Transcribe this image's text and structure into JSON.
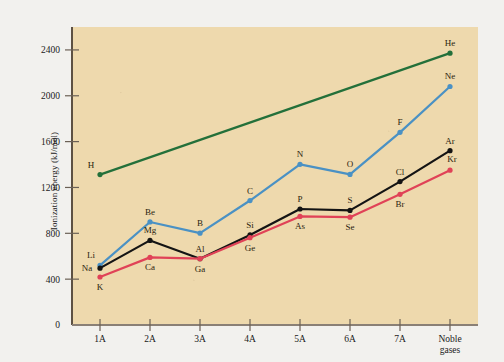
{
  "chart_data": {
    "type": "line",
    "title": "",
    "xlabel": "",
    "ylabel": "Ionization energy (kJ/mol)",
    "categories": [
      "1A",
      "2A",
      "3A",
      "4A",
      "5A",
      "6A",
      "7A",
      "Noble gases"
    ],
    "ylim": [
      0,
      2600
    ],
    "yticks": [
      0,
      400,
      800,
      1200,
      1600,
      2000,
      2400
    ],
    "ytick_labels": [
      "0",
      "400",
      "800",
      "1200",
      "1600",
      "2000",
      "2400"
    ],
    "grid": false,
    "legend": "none",
    "background_color": "#eed9ad",
    "series": [
      {
        "name": "Period 1",
        "color": "#23703a",
        "points": [
          {
            "category": "1A",
            "label": "H",
            "value": 1312,
            "label_pos": "above-left"
          },
          {
            "category": "Noble gases",
            "label": "He",
            "value": 2372,
            "label_pos": "above"
          }
        ]
      },
      {
        "name": "Period 2",
        "color": "#4a91c4",
        "points": [
          {
            "category": "1A",
            "label": "Li",
            "value": 520,
            "label_pos": "above-left"
          },
          {
            "category": "2A",
            "label": "Be",
            "value": 899,
            "label_pos": "above"
          },
          {
            "category": "3A",
            "label": "B",
            "value": 801,
            "label_pos": "above"
          },
          {
            "category": "4A",
            "label": "C",
            "value": 1086,
            "label_pos": "above"
          },
          {
            "category": "5A",
            "label": "N",
            "value": 1402,
            "label_pos": "above"
          },
          {
            "category": "6A",
            "label": "O",
            "value": 1314,
            "label_pos": "above"
          },
          {
            "category": "7A",
            "label": "F",
            "value": 1681,
            "label_pos": "above"
          },
          {
            "category": "Noble gases",
            "label": "Ne",
            "value": 2081,
            "label_pos": "above"
          }
        ]
      },
      {
        "name": "Period 3",
        "color": "#141414",
        "points": [
          {
            "category": "1A",
            "label": "Na",
            "value": 496,
            "label_pos": "left"
          },
          {
            "category": "2A",
            "label": "Mg",
            "value": 738,
            "label_pos": "above"
          },
          {
            "category": "3A",
            "label": "Al",
            "value": 578,
            "label_pos": "above"
          },
          {
            "category": "4A",
            "label": "Si",
            "value": 786,
            "label_pos": "above"
          },
          {
            "category": "5A",
            "label": "P",
            "value": 1012,
            "label_pos": "above"
          },
          {
            "category": "6A",
            "label": "S",
            "value": 1000,
            "label_pos": "above"
          },
          {
            "category": "7A",
            "label": "Cl",
            "value": 1251,
            "label_pos": "above"
          },
          {
            "category": "Noble gases",
            "label": "Ar",
            "value": 1521,
            "label_pos": "above"
          }
        ]
      },
      {
        "name": "Period 4",
        "color": "#e04257",
        "points": [
          {
            "category": "1A",
            "label": "K",
            "value": 419,
            "label_pos": "below"
          },
          {
            "category": "2A",
            "label": "Ca",
            "value": 590,
            "label_pos": "below"
          },
          {
            "category": "3A",
            "label": "Ga",
            "value": 579,
            "label_pos": "below"
          },
          {
            "category": "4A",
            "label": "Ge",
            "value": 762,
            "label_pos": "below"
          },
          {
            "category": "5A",
            "label": "As",
            "value": 947,
            "label_pos": "below"
          },
          {
            "category": "6A",
            "label": "Se",
            "value": 941,
            "label_pos": "below"
          },
          {
            "category": "7A",
            "label": "Br",
            "value": 1140,
            "label_pos": "below"
          },
          {
            "category": "Noble gases",
            "label": "Kr",
            "value": 1351,
            "label_pos": "above-right"
          }
        ]
      }
    ]
  }
}
